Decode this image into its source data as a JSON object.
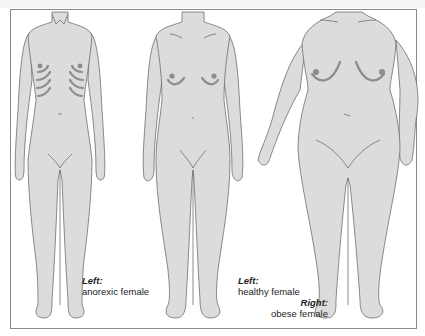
{
  "figure": {
    "figures": [
      {
        "id": "left",
        "description": "anorexic female"
      },
      {
        "id": "middle",
        "description": "healthy female"
      },
      {
        "id": "right",
        "description": "obese female"
      }
    ],
    "captions": {
      "caption1": {
        "heading": "Left:",
        "text": "anorexic female"
      },
      "caption2": {
        "heading_left": "Left:",
        "text_left": "healthy female",
        "heading_right": "Right:",
        "text_right": "obese female"
      }
    },
    "colors": {
      "skin": "#dcdcdc",
      "outline": "#6e6e6e",
      "shadow": "#8c8c8c",
      "frame": "#8a8a8a"
    }
  }
}
